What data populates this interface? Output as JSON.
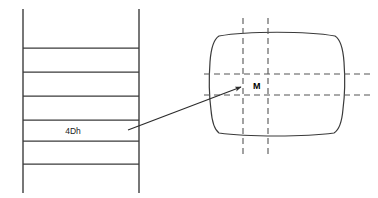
{
  "diagram": {
    "background_color": "#ffffff",
    "line_color": "#3a3a3a",
    "dash_color": "#555555",
    "width": 378,
    "height": 198
  },
  "stack": {
    "name": "layer-stack",
    "left_rail_x": 23,
    "right_rail_x": 139,
    "rail_top_y": 9,
    "rail_bottom_y": 193,
    "rung_y_values": [
      48,
      72,
      96,
      120,
      141,
      164
    ],
    "label": "4Dh",
    "label_x": 73,
    "label_y": 131
  },
  "leader": {
    "name": "callout-arrow",
    "start_x": 128,
    "start_y": 130,
    "end_x": 243,
    "end_y": 86
  },
  "cross_section": {
    "name": "barrel-cross-section",
    "left_x": 211,
    "right_x": 343,
    "top_y": 34,
    "bottom_y": 136,
    "point_label": "M",
    "point_label_x": 253,
    "point_label_y": 89,
    "center_point_x": 243,
    "center_point_y": 86
  },
  "centerlines": {
    "vertical_x_values": [
      243,
      268
    ],
    "vertical_top_y": 18,
    "vertical_bottom_y": 157,
    "horizontal_y_values": [
      74,
      95
    ],
    "horizontal_left_x": 204,
    "horizontal_right_x": 372
  }
}
